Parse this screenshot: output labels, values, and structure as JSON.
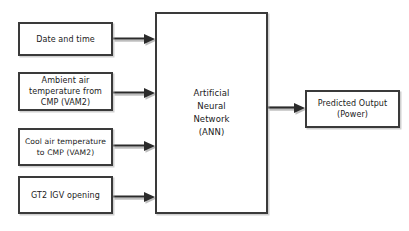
{
  "diagram": {
    "type": "block-flow-diagram",
    "colors": {
      "background": "#ffffff",
      "box_fill": "#ffffff",
      "box_border": "#3a3a3a",
      "arrow": "#2b2b2b",
      "text": "#1a1a1a",
      "shadow": "#aaaaaa"
    },
    "nodes": [
      {
        "id": "date-and-time",
        "label": "Date and time",
        "role": "input"
      },
      {
        "id": "ambient-air",
        "label": "Ambient air\ntemperature from\nCMP (VAM2)",
        "role": "input"
      },
      {
        "id": "cool-air",
        "label": "Cool air temperature\nto CMP (VAM2)",
        "role": "input"
      },
      {
        "id": "gt2-igv",
        "label": "GT2 IGV opening",
        "role": "input"
      },
      {
        "id": "ann",
        "label": "Artificial\nNeural\nNetwork\n(ANN)",
        "role": "model"
      },
      {
        "id": "predicted-output",
        "label": "Predicted Output\n(Power)",
        "role": "output"
      }
    ],
    "edges": [
      {
        "id": "edge-date-to-ann",
        "from": "date-and-time",
        "to": "ann",
        "direction": "right"
      },
      {
        "id": "edge-ambient-to-ann",
        "from": "ambient-air",
        "to": "ann",
        "direction": "right"
      },
      {
        "id": "edge-cool-to-ann",
        "from": "cool-air",
        "to": "ann",
        "direction": "right"
      },
      {
        "id": "edge-gt2-to-ann",
        "from": "gt2-igv",
        "to": "ann",
        "direction": "right"
      },
      {
        "id": "edge-ann-to-output",
        "from": "ann",
        "to": "predicted-output",
        "direction": "right"
      }
    ]
  }
}
